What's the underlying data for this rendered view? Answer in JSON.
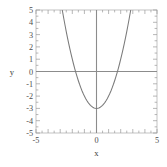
{
  "chart_data": {
    "type": "line",
    "title": "",
    "subtitle": "",
    "xlabel": "x",
    "ylabel": "y",
    "xlim": [
      -5,
      5
    ],
    "ylim": [
      -5,
      5
    ],
    "grid": false,
    "legend": null,
    "x_ticks_major": [
      -5,
      0,
      5
    ],
    "x_ticklabels": [
      "-5",
      "0",
      "5"
    ],
    "y_ticks_major": [
      5,
      4,
      3,
      2,
      1,
      0,
      -1,
      -2,
      -3,
      -4,
      -5
    ],
    "y_ticklabels": [
      "5",
      "4",
      "3",
      "2",
      "1",
      "0",
      "-1",
      "-2",
      "-3",
      "-4",
      "-5"
    ],
    "minor_tick_step": 0.5,
    "series": [
      {
        "name": "y = x^2 - 3",
        "color": "#7a7a7a",
        "x": [
          -2.83,
          -2.7,
          -2.6,
          -2.5,
          -2.4,
          -2.3,
          -2.2,
          -2.1,
          -2.0,
          -1.9,
          -1.8,
          -1.7,
          -1.6,
          -1.5,
          -1.4,
          -1.3,
          -1.2,
          -1.1,
          -1.0,
          -0.9,
          -0.8,
          -0.7,
          -0.6,
          -0.5,
          -0.4,
          -0.3,
          -0.2,
          -0.1,
          0.0,
          0.1,
          0.2,
          0.3,
          0.4,
          0.5,
          0.6,
          0.7,
          0.8,
          0.9,
          1.0,
          1.1,
          1.2,
          1.3,
          1.4,
          1.5,
          1.6,
          1.7,
          1.8,
          1.9,
          2.0,
          2.1,
          2.2,
          2.3,
          2.4,
          2.5,
          2.6,
          2.7,
          2.83
        ],
        "y": [
          5.0,
          4.29,
          3.76,
          3.25,
          2.76,
          2.29,
          1.84,
          1.41,
          1.0,
          0.61,
          0.24,
          -0.11,
          -0.44,
          -0.75,
          -1.04,
          -1.31,
          -1.56,
          -1.79,
          -2.0,
          -2.19,
          -2.36,
          -2.51,
          -2.64,
          -2.75,
          -2.84,
          -2.91,
          -2.96,
          -2.99,
          -3.0,
          -2.99,
          -2.96,
          -2.91,
          -2.84,
          -2.75,
          -2.64,
          -2.51,
          -2.36,
          -2.19,
          -2.0,
          -1.79,
          -1.56,
          -1.31,
          -1.04,
          -0.75,
          -0.44,
          -0.11,
          0.24,
          0.61,
          1.0,
          1.41,
          1.84,
          2.29,
          2.76,
          3.25,
          3.76,
          4.29,
          5.0
        ]
      }
    ],
    "annotations": {
      "vertex": {
        "x": 0,
        "y": -3
      },
      "x_intercepts": [
        -1.73,
        1.73
      ],
      "y_intercept": -3
    },
    "colors": {
      "curve": "#7a7a7a",
      "axis_line": "#8c8c8c",
      "frame": "#b3b3b3",
      "tick": "#999999",
      "text": "#4d4d4d",
      "background": "#ffffff"
    }
  }
}
